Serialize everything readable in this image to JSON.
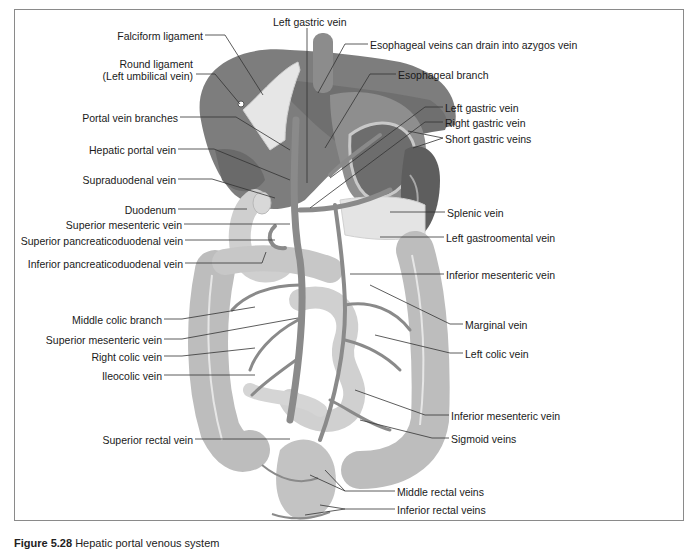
{
  "figure": {
    "title": "Hepatic portal venous system",
    "caption_number": "Figure 5.28",
    "caption_text": "Hepatic portal venous system"
  },
  "labels_left": [
    {
      "id": "falciform-ligament",
      "text": "Falciform ligament",
      "x": 203,
      "y": 31
    },
    {
      "id": "round-ligament-1",
      "text": "Round ligament",
      "x": 193,
      "y": 59
    },
    {
      "id": "round-ligament-2",
      "text": "(Left umbilical vein)",
      "x": 193,
      "y": 71
    },
    {
      "id": "portal-vein-branches",
      "text": "Portal vein branches",
      "x": 178,
      "y": 113
    },
    {
      "id": "hepatic-portal-vein",
      "text": "Hepatic portal vein",
      "x": 176,
      "y": 145
    },
    {
      "id": "supraduodenal-vein",
      "text": "Supraduodenal vein",
      "x": 176,
      "y": 175
    },
    {
      "id": "duodenum",
      "text": "Duodenum",
      "x": 176,
      "y": 205
    },
    {
      "id": "superior-mesenteric-vein-top",
      "text": "Superior mesenteric vein",
      "x": 182,
      "y": 220
    },
    {
      "id": "superior-pancreaticoduodenal-vein",
      "text": "Superior pancreaticoduodenal vein",
      "x": 183,
      "y": 236
    },
    {
      "id": "inferior-pancreaticoduodenal-vein",
      "text": "Inferior pancreaticoduodenal vein",
      "x": 183,
      "y": 259
    },
    {
      "id": "middle-colic-branch",
      "text": "Middle colic branch",
      "x": 162,
      "y": 315
    },
    {
      "id": "superior-mesenteric-vein-mid",
      "text": "Superior mesenteric vein",
      "x": 162,
      "y": 335
    },
    {
      "id": "right-colic-vein",
      "text": "Right colic vein",
      "x": 162,
      "y": 352
    },
    {
      "id": "ileocolic-vein",
      "text": "Ileocolic vein",
      "x": 162,
      "y": 371
    },
    {
      "id": "superior-rectal-vein",
      "text": "Superior rectal vein",
      "x": 193,
      "y": 435
    }
  ],
  "labels_right": [
    {
      "id": "left-gastric-vein-top",
      "text": "Left gastric vein",
      "x": 273,
      "y": 17
    },
    {
      "id": "esophageal-veins",
      "text": "Esophageal veins can drain into azygos vein",
      "x": 370,
      "y": 40
    },
    {
      "id": "esophageal-branch",
      "text": "Esophageal branch",
      "x": 398,
      "y": 70
    },
    {
      "id": "left-gastric-vein",
      "text": "Left gastric vein",
      "x": 445,
      "y": 103
    },
    {
      "id": "right-gastric-vein",
      "text": "Right gastric vein",
      "x": 445,
      "y": 118
    },
    {
      "id": "short-gastric-veins",
      "text": "Short gastric veins",
      "x": 445,
      "y": 134
    },
    {
      "id": "splenic-vein",
      "text": "Splenic vein",
      "x": 447,
      "y": 208
    },
    {
      "id": "left-gastroomental-vein",
      "text": "Left gastroomental vein",
      "x": 446,
      "y": 233
    },
    {
      "id": "inferior-mesenteric-vein-top",
      "text": "Inferior mesenteric vein",
      "x": 446,
      "y": 270
    },
    {
      "id": "marginal-vein",
      "text": "Marginal vein",
      "x": 465,
      "y": 320
    },
    {
      "id": "left-colic-vein",
      "text": "Left colic vein",
      "x": 465,
      "y": 349
    },
    {
      "id": "inferior-mesenteric-vein-low",
      "text": "Inferior mesenteric vein",
      "x": 451,
      "y": 411
    },
    {
      "id": "sigmoid-veins",
      "text": "Sigmoid veins",
      "x": 451,
      "y": 434
    },
    {
      "id": "middle-rectal-veins",
      "text": "Middle rectal veins",
      "x": 397,
      "y": 487
    },
    {
      "id": "inferior-rectal-veins",
      "text": "Inferior rectal veins",
      "x": 397,
      "y": 505
    }
  ],
  "colors": {
    "liver": "#7d7d7d",
    "liver_dark": "#6a6a6a",
    "stomach": "#8e8e8e",
    "spleen": "#5e5e5e",
    "veins": "#8a8a8a",
    "intestine": "#bdbdbd",
    "intestine_light": "#d3d3d3",
    "pancreas": "#e4e4e4",
    "ligament": "#e6e6e6",
    "leader_line": "#333333",
    "frame": "#8a8a8a"
  }
}
